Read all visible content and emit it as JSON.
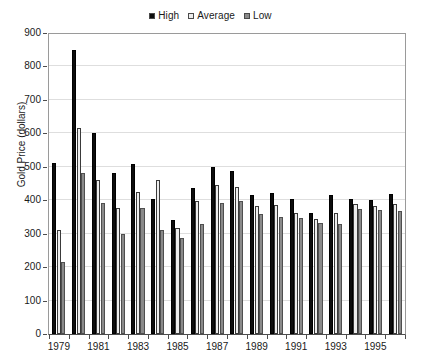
{
  "chart_data": {
    "type": "bar",
    "title": "",
    "subtitle": "",
    "xlabel": "",
    "ylabel": "Gold Price (dollars)",
    "ylim": [
      0,
      900
    ],
    "ytick_step": 100,
    "yticks": [
      "900",
      "800",
      "700",
      "600",
      "500",
      "400",
      "300",
      "200",
      "100",
      "0"
    ],
    "grid": true,
    "legend_position": "top-center",
    "categories": [
      "1979",
      "1980",
      "1981",
      "1982",
      "1983",
      "1984",
      "1985",
      "1986",
      "1987",
      "1988",
      "1989",
      "1990",
      "1991",
      "1992",
      "1993",
      "1994",
      "1995",
      "1996"
    ],
    "xtick_labels": [
      "1979",
      "1981",
      "1983",
      "1985",
      "1987",
      "1989",
      "1991",
      "1993",
      "1995"
    ],
    "series": [
      {
        "name": "High",
        "color": "#0d0d0d",
        "values": [
          510,
          850,
          600,
          480,
          508,
          405,
          341,
          438,
          500,
          486,
          417,
          423,
          404,
          362,
          415,
          403,
          402,
          418
        ]
      },
      {
        "name": "Average",
        "color": "#ededed",
        "values": [
          310,
          615,
          460,
          378,
          424,
          461,
          318,
          398,
          446,
          440,
          382,
          385,
          363,
          344,
          363,
          389,
          384,
          390
        ]
      },
      {
        "name": "Low",
        "color": "#8a8a8a",
        "values": [
          215,
          480,
          392,
          300,
          377,
          311,
          287,
          329,
          393,
          398,
          359,
          350,
          348,
          333,
          330,
          373,
          372,
          367
        ]
      }
    ]
  },
  "legend": {
    "items": [
      {
        "label": "High",
        "swatch_color": "#0d0d0d"
      },
      {
        "label": "Average",
        "swatch_color": "#ededed"
      },
      {
        "label": "Low",
        "swatch_color": "#8a8a8a"
      }
    ]
  },
  "axes": {
    "y_title": "Gold Price (dollars)"
  }
}
